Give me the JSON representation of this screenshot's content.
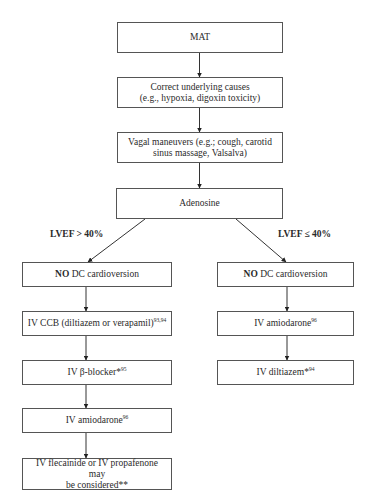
{
  "diagram": {
    "type": "flowchart",
    "nodes": {
      "mat": {
        "text": "MAT"
      },
      "correct_causes": {
        "line1": "Correct underlying causes",
        "line2": "(e.g., hypoxia, digoxin toxicity)"
      },
      "vagal": {
        "line1": "Vagal maneuvers (e.g.; cough, carotid",
        "line2": "sinus massage, Valsalva)"
      },
      "adenosine": {
        "text": "Adenosine"
      },
      "left_no_dc": {
        "bold": "NO",
        "rest": " DC cardioversion"
      },
      "right_no_dc": {
        "bold": "NO",
        "rest": " DC cardioversion"
      },
      "iv_ccb": {
        "text": "IV CCB (diltiazem or verapamil)",
        "sup": "93,94"
      },
      "iv_beta_blocker": {
        "text": "IV β-blocker*",
        "sup": "95"
      },
      "iv_amiodarone_left": {
        "text": "IV amiodarone",
        "sup": "96"
      },
      "iv_flecainide": {
        "line1": "IV flecainide or IV propafenone may",
        "line2": "be considered**"
      },
      "iv_amiodarone_right": {
        "text": "IV amiodarone",
        "sup": "96"
      },
      "iv_diltiazem": {
        "text": "IV diltiazem*",
        "sup": "94"
      }
    },
    "branch_labels": {
      "left": "LVEF > 40%",
      "right": "LVEF ≤ 40%"
    },
    "edges": [
      [
        "mat",
        "correct_causes"
      ],
      [
        "correct_causes",
        "vagal"
      ],
      [
        "vagal",
        "adenosine"
      ],
      [
        "adenosine",
        "left_no_dc"
      ],
      [
        "adenosine",
        "right_no_dc"
      ],
      [
        "left_no_dc",
        "iv_ccb"
      ],
      [
        "iv_ccb",
        "iv_beta_blocker"
      ],
      [
        "iv_beta_blocker",
        "iv_amiodarone_left"
      ],
      [
        "iv_amiodarone_left",
        "iv_flecainide"
      ],
      [
        "right_no_dc",
        "iv_amiodarone_right"
      ],
      [
        "iv_amiodarone_right",
        "iv_diltiazem"
      ]
    ],
    "colors": {
      "line": "#333333",
      "border": "#555555",
      "background": "#ffffff"
    }
  }
}
